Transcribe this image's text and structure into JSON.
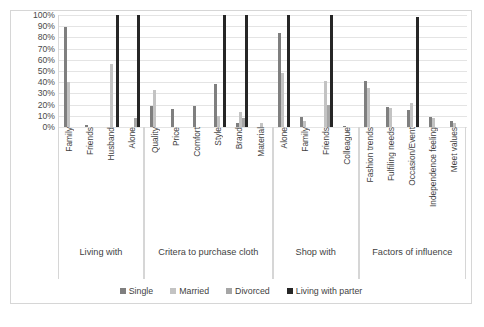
{
  "chart_data": {
    "type": "bar",
    "title": "",
    "xlabel": "",
    "ylabel": "",
    "ylim": [
      0,
      100
    ],
    "grid": true,
    "legend_position": "bottom",
    "y_ticks": [
      "100%",
      "90%",
      "80%",
      "70%",
      "60%",
      "50%",
      "40%",
      "30%",
      "20%",
      "10%",
      "0%"
    ],
    "series_names": [
      "Single",
      "Married",
      "Divorced",
      "Living with parter"
    ],
    "series_colors": [
      "#7f7f7f",
      "#c3c3c3",
      "#a6a6a6",
      "#262626"
    ],
    "groups": [
      {
        "title": "Living with",
        "categories": [
          "Family",
          "Friends",
          "Husband",
          "Alone"
        ],
        "series": [
          {
            "name": "Single",
            "values": [
              89,
              2,
              0,
              0
            ]
          },
          {
            "name": "Married",
            "values": [
              40,
              0,
              56,
              0
            ]
          },
          {
            "name": "Divorced",
            "values": [
              0,
              0,
              0,
              8
            ]
          },
          {
            "name": "Living with parter",
            "values": [
              0,
              0,
              100,
              100
            ]
          }
        ]
      },
      {
        "title": "Critera to purchase cloth",
        "categories": [
          "Quality",
          "Price",
          "Comfort",
          "Style",
          "Brand",
          "Material"
        ],
        "series": [
          {
            "name": "Single",
            "values": [
              19,
              16,
              19,
              38,
              4,
              0
            ]
          },
          {
            "name": "Married",
            "values": [
              33,
              0,
              0,
              10,
              13,
              4
            ]
          },
          {
            "name": "Divorced",
            "values": [
              0,
              0,
              0,
              0,
              8,
              0
            ]
          },
          {
            "name": "Living with parter",
            "values": [
              0,
              0,
              0,
              100,
              100,
              0
            ]
          }
        ]
      },
      {
        "title": "Shop with",
        "categories": [
          "Alone",
          "Family",
          "Friends",
          "Colleague"
        ],
        "series": [
          {
            "name": "Single",
            "values": [
              84,
              9,
              0,
              1
            ]
          },
          {
            "name": "Married",
            "values": [
              48,
              5,
              41,
              0
            ]
          },
          {
            "name": "Divorced",
            "values": [
              0,
              0,
              20,
              0
            ]
          },
          {
            "name": "Living with parter",
            "values": [
              100,
              0,
              100,
              0
            ]
          }
        ]
      },
      {
        "title": "Factors of influence",
        "categories": [
          "Fashion trends",
          "Fulfiling needs",
          "Occasion/Event",
          "Independence feeling",
          "Meet values"
        ],
        "series": [
          {
            "name": "Single",
            "values": [
              41,
              18,
              15,
              9,
              5
            ]
          },
          {
            "name": "Married",
            "values": [
              35,
              17,
              21,
              8,
              4
            ]
          },
          {
            "name": "Divorced",
            "values": [
              0,
              0,
              0,
              0,
              0
            ]
          },
          {
            "name": "Living with parter",
            "values": [
              0,
              0,
              98,
              0,
              0
            ]
          }
        ]
      }
    ]
  }
}
